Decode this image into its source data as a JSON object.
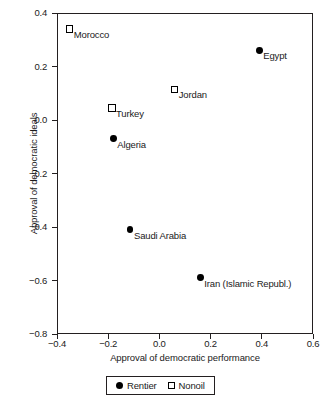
{
  "chart_data": {
    "type": "scatter",
    "title": "",
    "xlabel": "Approval of democratic performance",
    "ylabel": "Approval of democratic ideals",
    "xlim": [
      -0.4,
      0.6
    ],
    "ylim": [
      -0.8,
      0.4
    ],
    "xticks": [
      "-0.4",
      "-0.2",
      "0.0",
      "0.2",
      "0.4",
      "0.6"
    ],
    "xtick_values": [
      -0.4,
      -0.2,
      0.0,
      0.2,
      0.4,
      0.6
    ],
    "yticks": [
      "0.4",
      "0.2",
      "0.0",
      "-0.2",
      "-0.4",
      "-0.6",
      "-0.8"
    ],
    "ytick_values": [
      0.4,
      0.2,
      0.0,
      -0.2,
      -0.4,
      -0.6,
      -0.8
    ],
    "grid": false,
    "legend_position": "bottom-center",
    "series": [
      {
        "name": "Rentier",
        "marker": "filled-circle",
        "color": "#000000",
        "points": [
          {
            "label": "Egypt",
            "x": 0.39,
            "y": 0.26
          },
          {
            "label": "Algeria",
            "x": -0.18,
            "y": -0.07
          },
          {
            "label": "Saudi Arabia",
            "x": -0.115,
            "y": -0.41
          },
          {
            "label": "Iran (Islamic Republ.)",
            "x": 0.16,
            "y": -0.59
          }
        ]
      },
      {
        "name": "Nonoil",
        "marker": "open-square",
        "color": "#000000",
        "points": [
          {
            "label": "Morocco",
            "x": -0.35,
            "y": 0.34
          },
          {
            "label": "Jordan",
            "x": 0.06,
            "y": 0.115
          },
          {
            "label": "Turkey",
            "x": -0.185,
            "y": 0.045
          }
        ]
      }
    ]
  },
  "legend": {
    "entries": [
      {
        "label": "Rentier",
        "marker": "filled-circle"
      },
      {
        "label": "Nonoil",
        "marker": "open-square"
      }
    ]
  }
}
